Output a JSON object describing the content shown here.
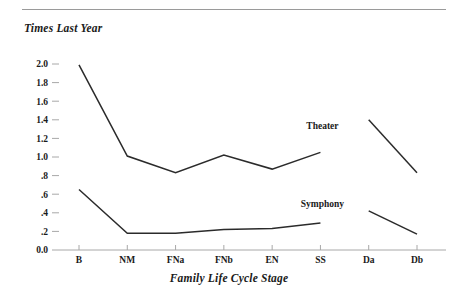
{
  "chart_data": {
    "type": "line",
    "title": "",
    "ylabel": "Times Last Year",
    "xlabel": "Family Life Cycle Stage",
    "categories": [
      "B",
      "NM",
      "FNa",
      "FNb",
      "EN",
      "SS",
      "Da",
      "Db"
    ],
    "ylim": [
      0.0,
      2.0
    ],
    "ytick_labels": [
      "2.0",
      "1.8",
      "1.6",
      "1.4",
      "1.2",
      "1.0",
      ".8",
      ".6",
      ".4",
      ".2",
      "0.0"
    ],
    "ytick_values": [
      2.0,
      1.8,
      1.6,
      1.4,
      1.2,
      1.0,
      0.8,
      0.6,
      0.4,
      0.2,
      0.0
    ],
    "grid": false,
    "legend_position": "inline-annotation",
    "series": [
      {
        "name": "Theater",
        "values": [
          1.99,
          1.01,
          0.83,
          1.02,
          0.87,
          1.05,
          1.4,
          0.83
        ],
        "gap_after_category": "SS",
        "label_x_category": "SS",
        "label_value": 1.3
      },
      {
        "name": "Symphony",
        "values": [
          0.65,
          0.18,
          0.18,
          0.22,
          0.23,
          0.29,
          0.42,
          0.17
        ],
        "gap_after_category": "SS",
        "label_x_category": "SS",
        "label_value": 0.46
      }
    ],
    "colors": {
      "line": "#2b2b2b",
      "axis": "#a8a8a8",
      "text": "#1a1a1a",
      "background": "#ffffff",
      "rule": "#9a9a9a"
    }
  }
}
